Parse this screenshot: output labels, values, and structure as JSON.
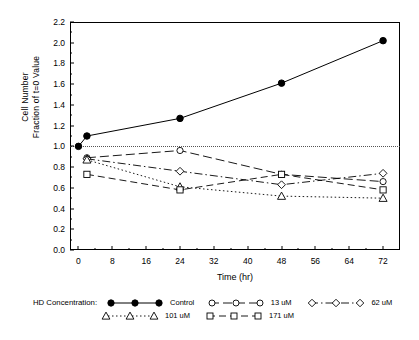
{
  "chart_data": {
    "type": "line",
    "title": "",
    "xlabel": "Time (hr)",
    "ylabel": "Cell Number\nFraction of t=0 Value",
    "ylabel_line1": "Cell Number",
    "ylabel_line2": "Fraction of t=0 Value",
    "xlim": [
      -2,
      76
    ],
    "ylim": [
      0.0,
      2.2
    ],
    "xticks": [
      0,
      8,
      16,
      24,
      32,
      40,
      48,
      56,
      64,
      72
    ],
    "yticks": [
      "0.0",
      "0.2",
      "0.4",
      "0.6",
      "0.8",
      "1.0",
      "1.2",
      "1.4",
      "1.6",
      "1.8",
      "2.0",
      "2.2"
    ],
    "grid": false,
    "reference_line": {
      "y": 1.0,
      "style": "dotted"
    },
    "legend_position": "bottom",
    "legend_title": "HD Concentration:",
    "series": [
      {
        "name": "Control",
        "marker": "filled-circle",
        "line": "solid",
        "x": [
          0,
          2,
          24,
          48,
          72
        ],
        "values": [
          1.0,
          1.1,
          1.27,
          1.61,
          2.02
        ]
      },
      {
        "name": "13 uM",
        "marker": "open-circle",
        "line": "long-dash",
        "x": [
          2,
          24,
          48,
          72
        ],
        "values": [
          0.89,
          0.96,
          0.73,
          0.66
        ]
      },
      {
        "name": "62 uM",
        "marker": "open-diamond",
        "line": "dash-dot",
        "x": [
          2,
          24,
          48,
          72
        ],
        "values": [
          0.88,
          0.76,
          0.63,
          0.74
        ]
      },
      {
        "name": "101 uM",
        "marker": "open-triangle",
        "line": "dotted",
        "x": [
          2,
          24,
          48,
          72
        ],
        "values": [
          0.87,
          0.61,
          0.52,
          0.5
        ]
      },
      {
        "name": "171 uM",
        "marker": "open-square",
        "line": "dash",
        "x": [
          2,
          24,
          48,
          72
        ],
        "values": [
          0.73,
          0.58,
          0.73,
          0.58
        ]
      }
    ]
  },
  "legend": {
    "title": "HD Concentration:",
    "entries": [
      {
        "label": "Control"
      },
      {
        "label": "13 uM"
      },
      {
        "label": "62 uM"
      },
      {
        "label": "101 uM"
      },
      {
        "label": "171 uM"
      }
    ]
  },
  "caption": ""
}
